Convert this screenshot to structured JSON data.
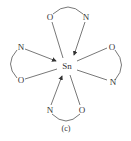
{
  "diagram": {
    "center_atom": "Sn",
    "caption": "(c)",
    "ligands": [
      {
        "position": "top",
        "atoms": [
          "O",
          "N"
        ],
        "donor_arrow": "N"
      },
      {
        "position": "left",
        "atoms": [
          "N",
          "O"
        ],
        "donor_arrow": "N"
      },
      {
        "position": "right",
        "atoms": [
          "O",
          "N"
        ],
        "donor_arrow": null
      },
      {
        "position": "bottom",
        "atoms": [
          "N",
          "O"
        ],
        "donor_arrow": "N"
      }
    ],
    "labels": {
      "top_o": "O",
      "top_n": "N",
      "left_n": "N",
      "left_o": "O",
      "right_o": "O",
      "right_n": "N",
      "bottom_n": "N",
      "bottom_o": "O"
    },
    "colors": {
      "stroke": "#555555",
      "text": "#333333"
    }
  }
}
